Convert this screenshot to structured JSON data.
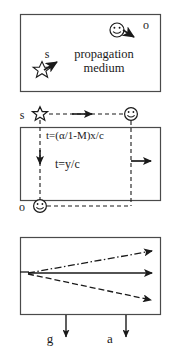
{
  "figure": {
    "background_color": "#ffffff",
    "stroke_color": "#333333",
    "panels": [
      {
        "id": "panel-top",
        "name": "propagation-medium-panel",
        "box": {
          "x": 20,
          "y": 14,
          "w": 141,
          "h": 78
        },
        "medium_label_line1": "propagation",
        "medium_label_line2": "medium",
        "source_label": "s",
        "observer_label": "o",
        "source_icon": "star-icon",
        "observer_icon": "smiley-face-icon",
        "source_motion_arrow": "arrow-up-right-icon",
        "observer_motion_arrow": "arrow-down-right-icon"
      },
      {
        "id": "panel-middle",
        "name": "timing-panel",
        "box": {
          "x": 20,
          "y": 127,
          "w": 141,
          "h": 74
        },
        "source_label": "s",
        "observer_label": "o",
        "source_icon": "star-icon",
        "observer_icon_top": "smiley-face-icon",
        "observer_icon_bottom": "smiley-face-icon",
        "formula_horizontal": "t=(α/1-M)x/c",
        "formula_vertical": "t=y/c",
        "arrow_right_top": "dashed-arrow-right-icon",
        "arrow_down_left": "dashed-arrow-down-icon",
        "arrow_right_middle": "solid-arrow-right-icon",
        "arrow_dashed_bottom": "dashed-line-icon"
      },
      {
        "id": "panel-bottom",
        "name": "ray-divergence-panel",
        "box": {
          "x": 20,
          "y": 237,
          "w": 141,
          "h": 78
        },
        "ray_upper_style": "dash-dot",
        "ray_middle_style": "solid",
        "ray_lower_style": "dashed",
        "label_left": "g",
        "label_right": "a",
        "arrow_down_left": "arrow-down-icon",
        "arrow_down_right": "arrow-down-icon"
      }
    ]
  }
}
